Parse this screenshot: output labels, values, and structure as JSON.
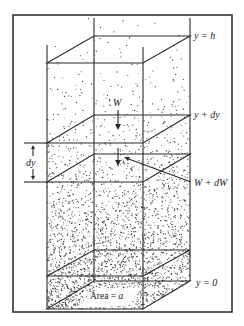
{
  "diagram": {
    "type": "fluid column hydrostatic element",
    "labels": {
      "top_level": "y = h",
      "upper_plane": "y + dy",
      "thickness": "dy",
      "weight_above": "W",
      "weight_below": "W + dW",
      "bottom_level": "y = 0",
      "area_prefix": "Área = ",
      "area_symbol": "a"
    },
    "colors": {
      "line": "#2a2a2a",
      "frame": "#333333",
      "dots": "#3a3a3a",
      "background": "#ffffff"
    }
  }
}
